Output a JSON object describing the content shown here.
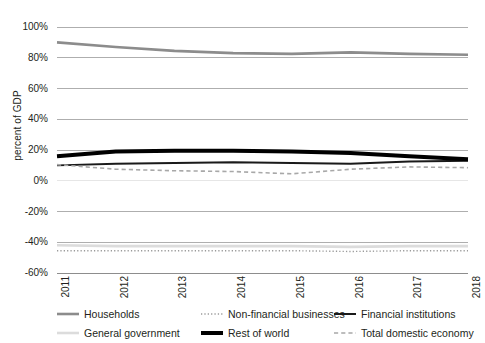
{
  "chart_data": {
    "type": "line",
    "title": "",
    "xlabel": "",
    "ylabel": "percent of GDP",
    "grid": true,
    "legend_position": "bottom",
    "x": [
      "2011",
      "2012",
      "2013",
      "2014",
      "2015",
      "2016",
      "2017",
      "2018"
    ],
    "xtick_labels": [
      "2011",
      "2012",
      "2013",
      "2014",
      "2015",
      "2016",
      "2017",
      "2018"
    ],
    "ytick_labels": [
      "100%",
      "80%",
      "60%",
      "40%",
      "20%",
      "0%",
      "-20%",
      "-40%",
      "-60%"
    ],
    "ytick_values": [
      100,
      80,
      60,
      40,
      20,
      0,
      -20,
      -40,
      -60
    ],
    "ylim": [
      -60,
      100
    ],
    "series": [
      {
        "name": "Households",
        "color": "#8c8c8c",
        "style": "solid",
        "width": 2.6,
        "values": [
          90,
          87,
          84.5,
          83,
          82.5,
          83.5,
          82.5,
          82
        ]
      },
      {
        "name": "General government",
        "color": "#dcdcdc",
        "style": "solid",
        "width": 2.6,
        "values": [
          -42,
          -42.5,
          -42.5,
          -42.5,
          -42.5,
          -43,
          -42.5,
          -42.5
        ]
      },
      {
        "name": "Non-financial businesses",
        "color": "#9a9a9a",
        "style": "dotted",
        "width": 1.4,
        "values": [
          -45.5,
          -45.5,
          -45.5,
          -45.5,
          -45.5,
          -46,
          -45.5,
          -45.5
        ]
      },
      {
        "name": "Financial institutions",
        "color": "#1a1a1a",
        "style": "solid",
        "width": 2.0,
        "values": [
          10,
          11,
          11.5,
          12,
          11.5,
          11,
          12.5,
          13
        ]
      },
      {
        "name": "Rest of world",
        "color": "#000000",
        "style": "solid",
        "width": 4.0,
        "values": [
          16,
          19,
          19.5,
          19.5,
          19,
          18,
          16,
          14
        ]
      },
      {
        "name": "Total domestic economy",
        "color": "#a8a8a8",
        "style": "dashed",
        "width": 1.6,
        "values": [
          10.5,
          7.5,
          6.5,
          6,
          4.5,
          7.5,
          9,
          8.5
        ]
      }
    ]
  },
  "legend": {
    "items": [
      {
        "label": "Households",
        "series_index": 0
      },
      {
        "label": "Non-financial businesses",
        "series_index": 2
      },
      {
        "label": "Financial institutions",
        "series_index": 3
      },
      {
        "label": "General government",
        "series_index": 1
      },
      {
        "label": "Rest of world",
        "series_index": 4
      },
      {
        "label": "Total domestic economy",
        "series_index": 5
      }
    ]
  },
  "axes": {
    "y_title": "percent of GDP"
  }
}
